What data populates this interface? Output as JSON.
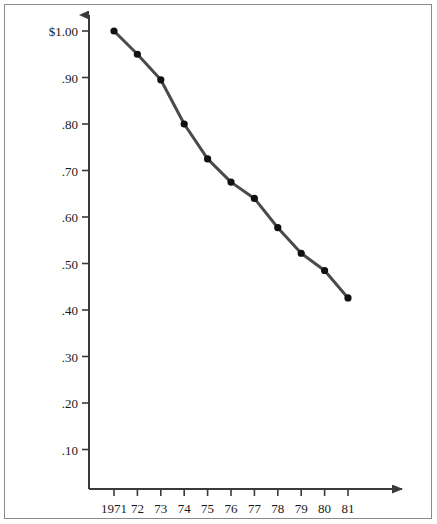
{
  "chart_data": {
    "type": "line",
    "title": "",
    "subtitle": "",
    "xlabel": "",
    "ylabel": "",
    "categories": [
      "1971",
      "72",
      "73",
      "74",
      "75",
      "76",
      "77",
      "78",
      "79",
      "80",
      "81"
    ],
    "x": [
      1971,
      1972,
      1973,
      1974,
      1975,
      1976,
      1977,
      1978,
      1979,
      1980,
      1981
    ],
    "values": [
      1.0,
      0.95,
      0.895,
      0.8,
      0.725,
      0.675,
      0.64,
      0.577,
      0.522,
      0.485,
      0.426
    ],
    "series": [
      {
        "name": "",
        "values": [
          1.0,
          0.95,
          0.895,
          0.8,
          0.725,
          0.675,
          0.64,
          0.577,
          0.522,
          0.485,
          0.426
        ]
      }
    ],
    "y_tick_labels": [
      "$1.00",
      ".90",
      ".80",
      ".70",
      ".60",
      ".50",
      ".40",
      ".30",
      ".20",
      ".10"
    ],
    "y_tick_values": [
      1.0,
      0.9,
      0.8,
      0.7,
      0.6,
      0.5,
      0.4,
      0.3,
      0.2,
      0.1
    ],
    "x_tick_labels": [
      "1971",
      "72",
      "73",
      "74",
      "75",
      "76",
      "77",
      "78",
      "79",
      "80",
      "81"
    ],
    "ylim": [
      0.0,
      1.04
    ],
    "xlim": [
      1970.6,
      1982.6
    ],
    "grid": false,
    "legend": false,
    "legend_position": "none",
    "marker": "filled-circle",
    "line_color": "#4a4a4a",
    "marker_color": "#111111",
    "axis_color": "#3a3a3a",
    "background_color": "#ffffff",
    "axis_style": "arrow-ended-left-and-bottom-spines"
  },
  "axis": {
    "y_ticks": [
      {
        "label": "$1.00",
        "value": 1.0
      },
      {
        "label": ".90",
        "value": 0.9
      },
      {
        "label": ".80",
        "value": 0.8
      },
      {
        "label": ".70",
        "value": 0.7
      },
      {
        "label": ".60",
        "value": 0.6
      },
      {
        "label": ".50",
        "value": 0.5
      },
      {
        "label": ".40",
        "value": 0.4
      },
      {
        "label": ".30",
        "value": 0.3
      },
      {
        "label": ".20",
        "value": 0.2
      },
      {
        "label": ".10",
        "value": 0.1
      }
    ],
    "x_ticks": [
      {
        "label": "1971",
        "value": 1971
      },
      {
        "label": "72",
        "value": 1972
      },
      {
        "label": "73",
        "value": 1973
      },
      {
        "label": "74",
        "value": 1974
      },
      {
        "label": "75",
        "value": 1975
      },
      {
        "label": "76",
        "value": 1976
      },
      {
        "label": "77",
        "value": 1977
      },
      {
        "label": "78",
        "value": 1978
      },
      {
        "label": "79",
        "value": 1979
      },
      {
        "label": "80",
        "value": 1980
      },
      {
        "label": "81",
        "value": 1981
      }
    ]
  }
}
